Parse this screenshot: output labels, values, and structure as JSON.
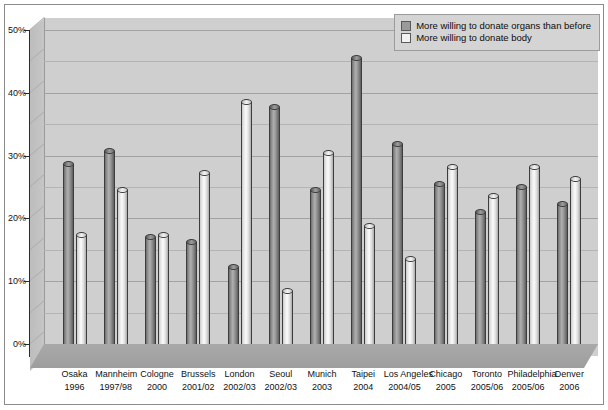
{
  "chart_data": {
    "type": "bar",
    "title": "",
    "subtitle": "",
    "xlabel": "",
    "ylabel": "",
    "ylim": [
      0,
      50
    ],
    "yticks": [
      0,
      10,
      20,
      30,
      40,
      50
    ],
    "ytick_labels": [
      "0%",
      "10%",
      "20%",
      "30%",
      "40%",
      "50%"
    ],
    "minor_gridlines": [
      5,
      15,
      25,
      35,
      45
    ],
    "grid": true,
    "legend_position": "top-right",
    "style": "3d-cylinder",
    "categories": [
      "Osaka",
      "Mannheim",
      "Cologne",
      "Brussels",
      "London",
      "Seoul",
      "Munich",
      "Taipei",
      "Los Angeles",
      "Chicago",
      "Toronto",
      "Philadelphia",
      "Denver"
    ],
    "category_years": [
      "1996",
      "1997/98",
      "2000",
      "2001/02",
      "2002/03",
      "2002/03",
      "2003",
      "2004",
      "2004/05",
      "2005",
      "2005/06",
      "2005/06",
      "2006"
    ],
    "series": [
      {
        "name": "More willing to donate organs than before",
        "color": "#9a9a9a",
        "values": [
          28.6,
          30.7,
          17.0,
          16.2,
          12.2,
          37.8,
          24.5,
          45.5,
          31.9,
          25.5,
          21.1,
          25.0,
          22.3
        ]
      },
      {
        "name": "More willing to donate body",
        "color": "#f2f2f2",
        "values": [
          17.4,
          24.5,
          17.4,
          27.2,
          38.5,
          8.5,
          30.4,
          18.8,
          13.5,
          28.2,
          23.6,
          28.2,
          26.3
        ]
      }
    ]
  },
  "legend": {
    "items": [
      {
        "label": "More willing to donate organs than before",
        "swatch": "organs"
      },
      {
        "label": "More willing to donate body",
        "swatch": "bodys"
      }
    ]
  }
}
